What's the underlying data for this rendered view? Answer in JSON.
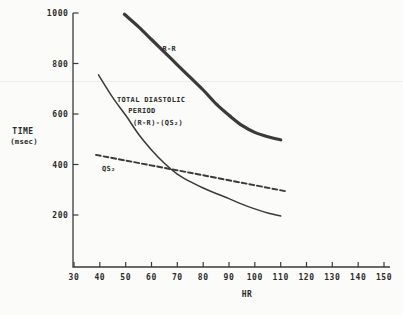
{
  "figure": {
    "background": "#fbfbf9",
    "ink_color": "#3a3a3a",
    "text_color": "#2b2b2b",
    "y_axis_title_line1": "TIME",
    "y_axis_title_line2": "(msec)",
    "x_axis_title": "HR"
  },
  "chart_data": {
    "type": "line",
    "title": "",
    "xlabel": "HR",
    "ylabel": "TIME (msec)",
    "grid": false,
    "legend_position": "inline-annotations",
    "x_axis": {
      "min": 30,
      "max": 150,
      "ticks": [
        30,
        40,
        50,
        60,
        70,
        80,
        90,
        100,
        110,
        120,
        130,
        140,
        150
      ]
    },
    "y_axis": {
      "min": 0,
      "max": 1000,
      "ticks": [
        200,
        400,
        600,
        800,
        1000
      ]
    },
    "series": [
      {
        "id": "rr",
        "name": "R-R",
        "line_style": "solid",
        "line_weight": "thick",
        "points": [
          [
            49.5,
            995
          ],
          [
            55,
            945
          ],
          [
            60,
            895
          ],
          [
            65,
            845
          ],
          [
            70,
            795
          ],
          [
            75,
            745
          ],
          [
            80,
            695
          ],
          [
            85,
            640
          ],
          [
            90,
            595
          ],
          [
            95,
            555
          ],
          [
            100,
            527
          ],
          [
            105,
            510
          ],
          [
            110,
            498
          ]
        ]
      },
      {
        "id": "total-diastolic",
        "name": "TOTAL DIASTOLIC PERIOD (R-R)-(QS₂)",
        "line_style": "solid",
        "line_weight": "thin",
        "points": [
          [
            39.5,
            755
          ],
          [
            45,
            665
          ],
          [
            50,
            595
          ],
          [
            55,
            520
          ],
          [
            60,
            458
          ],
          [
            65,
            405
          ],
          [
            70,
            362
          ],
          [
            75,
            332
          ],
          [
            80,
            307
          ],
          [
            85,
            285
          ],
          [
            90,
            265
          ],
          [
            95,
            243
          ],
          [
            100,
            224
          ],
          [
            105,
            208
          ],
          [
            110,
            196
          ]
        ]
      },
      {
        "id": "qs2",
        "name": "QS₂",
        "line_style": "dashed",
        "line_weight": "medium",
        "points": [
          [
            38.5,
            438
          ],
          [
            75,
            367
          ],
          [
            112,
            294
          ]
        ]
      }
    ],
    "annotations": [
      {
        "name": "rr-curve-label",
        "text": "R-R",
        "hr": 64.2,
        "msec": 858
      },
      {
        "name": "total-diastolic-label-line1",
        "text": "TOTAL DIASTOLIC",
        "hr": 46.6,
        "msec": 656
      },
      {
        "name": "total-diastolic-label-line2",
        "text": "PERIOD",
        "hr": 51.0,
        "msec": 613
      },
      {
        "name": "total-diastolic-label-line3",
        "text": "(R-R)-(QS₂)",
        "hr": 52.8,
        "msec": 566
      },
      {
        "name": "qs2-curve-label",
        "text": "QS₂",
        "hr": 40.8,
        "msec": 385
      }
    ]
  }
}
